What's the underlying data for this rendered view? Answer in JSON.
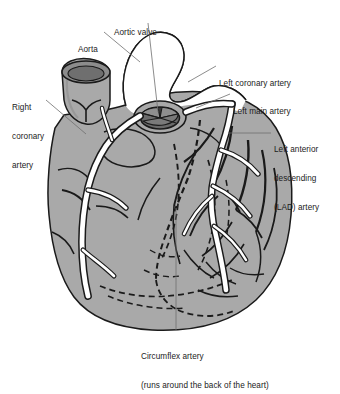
{
  "figure": {
    "type": "anatomical-diagram",
    "background_color": "#ffffff",
    "heart_fill": "#a9a9a9",
    "vessel_fill": "#ffffff",
    "outline_color": "#1a1a1a",
    "leader_color": "#6e6e6e",
    "text_color": "#1b1b1b"
  },
  "labels": {
    "aorta": {
      "lines": [
        "Aorta"
      ],
      "x": 78,
      "y": 27
    },
    "aortic_valve": {
      "lines": [
        "Aortic valve"
      ],
      "x": 114,
      "y": 10
    },
    "left_coronary_artery": {
      "lines": [
        "Left coronary artery"
      ],
      "x": 218,
      "y": 60
    },
    "left_main_artery": {
      "lines": [
        "Left main artery"
      ],
      "x": 232,
      "y": 88
    },
    "left_anterior_descending": {
      "lines": [
        "Left anterior",
        "descending",
        "(LAD) artery"
      ],
      "x": 273,
      "y": 125
    },
    "right_coronary_artery": {
      "lines": [
        "Right",
        "coronary",
        "artery"
      ],
      "x": 12,
      "y": 85
    },
    "circumflex_artery": {
      "lines": [
        "Circumflex artery",
        "(runs around the back of the heart)"
      ],
      "x": 141,
      "y": 334
    }
  }
}
